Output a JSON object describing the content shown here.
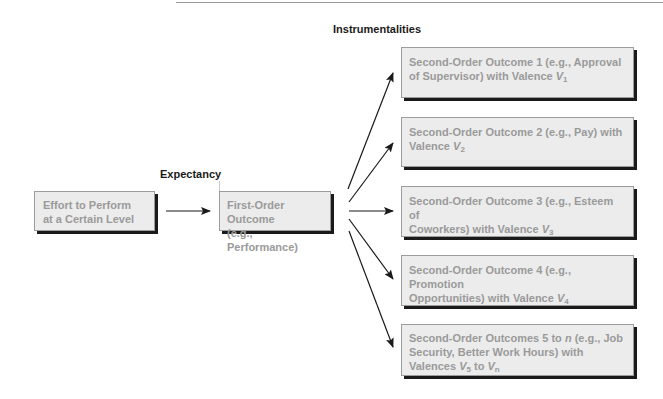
{
  "labels": {
    "instrumentalities": "Instrumentalities",
    "expectancy": "Expectancy"
  },
  "effort_box": {
    "line1": "Effort to Perform",
    "line2": "at a Certain Level"
  },
  "first_order_box": {
    "line1": "First-Order Outcome",
    "line2": "(e.g., Performance)"
  },
  "second_order_outcomes": [
    {
      "line1": "Second-Order Outcome 1 (e.g., Approval",
      "line2_prefix": "of Supervisor) with Valence ",
      "valence": "V",
      "subscript": "1"
    },
    {
      "line1": "Second-Order Outcome 2 (e.g., Pay) with",
      "line2_prefix": "Valence ",
      "valence": "V",
      "subscript": "2"
    },
    {
      "line1": "Second-Order Outcome 3 (e.g., Esteem of",
      "line2_prefix": "Coworkers) with Valence ",
      "valence": "V",
      "subscript": "3"
    },
    {
      "line1": "Second-Order Outcome 4 (e.g., Promotion",
      "line2_prefix": "Opportunities) with Valence ",
      "valence": "V",
      "subscript": "4"
    },
    {
      "line1_prefix": "Second-Order Outcomes 5 to ",
      "line1_n": "n",
      "line1_suffix": " (e.g., Job",
      "line2": "Security, Better Work Hours) with",
      "line3_prefix": "Valences ",
      "valence_a": "V",
      "subscript_a": "5",
      "to": " to ",
      "valence_b": "V",
      "subscript_b": "n"
    }
  ],
  "colors": {
    "box_fill": "#ececec",
    "box_text": "#9a9a9a",
    "shadow": "#1a1a1a",
    "arrow": "#1a1a1a"
  }
}
